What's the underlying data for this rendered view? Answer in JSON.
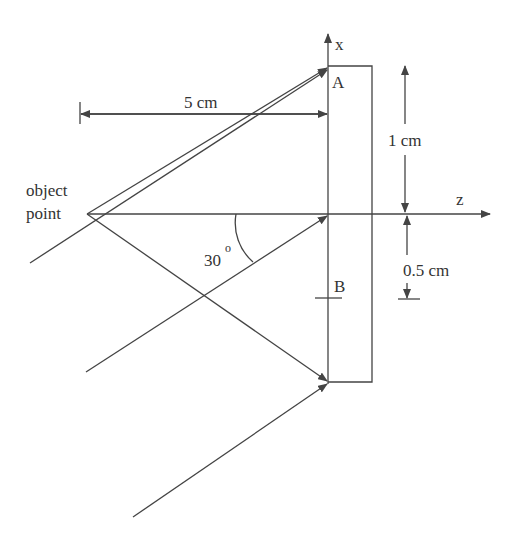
{
  "diagram": {
    "labels": {
      "x_axis": "x",
      "z_axis": "z",
      "point_a": "A",
      "point_b": "B",
      "object_line1": "object",
      "object_line2": "point",
      "distance": "5 cm",
      "height_upper": "1 cm",
      "height_lower": "0.5 cm",
      "angle": "30",
      "angle_degree": "o"
    },
    "colors": {
      "line": "#444444",
      "text": "#333333",
      "background": "#ffffff"
    }
  }
}
